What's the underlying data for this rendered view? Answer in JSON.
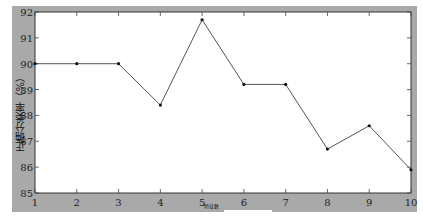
{
  "chart_data": {
    "type": "line",
    "title": "",
    "xlabel": "特征数",
    "ylabel": "正确分类率（%）",
    "x": [
      1,
      2,
      3,
      4,
      5,
      6,
      7,
      8,
      9,
      10
    ],
    "series": [
      {
        "name": "正确分类率",
        "values": [
          90.0,
          90.0,
          90.0,
          88.4,
          91.7,
          89.2,
          89.2,
          86.7,
          87.6,
          85.9
        ],
        "color": "#555555",
        "marker": "dot"
      }
    ],
    "xlim": [
      1,
      10
    ],
    "ylim": [
      85,
      92
    ],
    "xticks": [
      "1",
      "2",
      "3",
      "4",
      "5",
      "6",
      "7",
      "8",
      "9",
      "10"
    ],
    "yticks": [
      "85",
      "86",
      "87",
      "88",
      "89",
      "90",
      "91",
      "92"
    ],
    "grid": false,
    "legend": null
  }
}
